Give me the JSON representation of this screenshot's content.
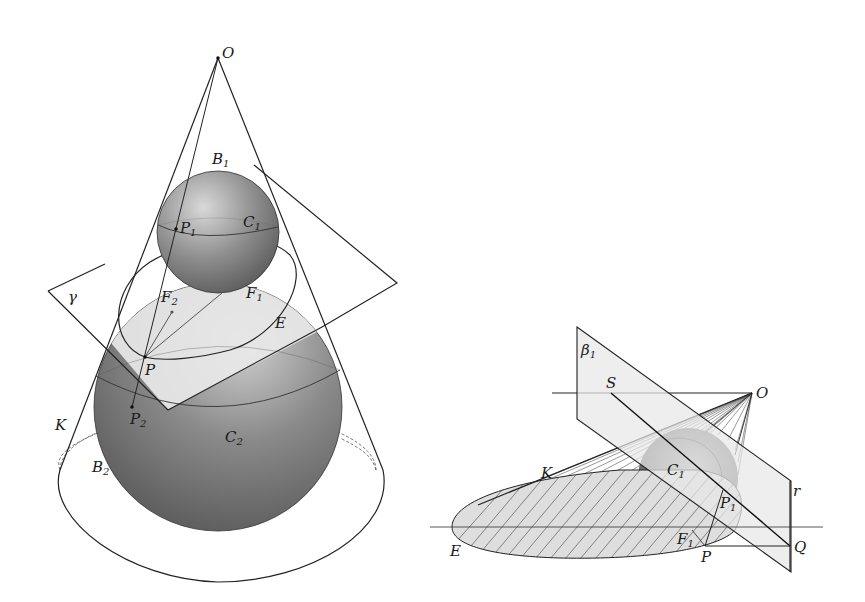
{
  "figure_left": {
    "title": "Dandelin spheres in cone (elliptic section)",
    "labels": {
      "apex": "O",
      "upper_sphere": "B",
      "upper_sphere_sub": "1",
      "upper_circle": "C",
      "upper_circle_sub": "1",
      "point_p1": "P",
      "point_p1_sub": "1",
      "plane": "γ",
      "focus_f1": "F",
      "focus_f1_sub": "1",
      "focus_f2": "F",
      "focus_f2_sub": "2",
      "ellipse": "E",
      "point_p": "P",
      "point_p2": "P",
      "point_p2_sub": "2",
      "cone": "K",
      "lower_circle": "C",
      "lower_circle_sub": "2",
      "lower_sphere": "B",
      "lower_sphere_sub": "2"
    }
  },
  "figure_right": {
    "title": "Cone with sphere and directrix plane",
    "labels": {
      "plane": "β",
      "plane_sub": "1",
      "point_s": "S",
      "apex": "O",
      "circle": "C",
      "circle_sub": "1",
      "cone": "K",
      "line_r": "r",
      "point_p1": "P",
      "point_p1_sub": "1",
      "focus": "F",
      "focus_sub": "1",
      "point_q": "Q",
      "point_p": "P",
      "ellipse": "E"
    }
  },
  "colors": {
    "sphere_light": "#c9c9c9",
    "sphere_dark": "#5a5a5a",
    "plane_fill": "#e6e6e6",
    "line": "#222222",
    "background": "#ffffff"
  }
}
